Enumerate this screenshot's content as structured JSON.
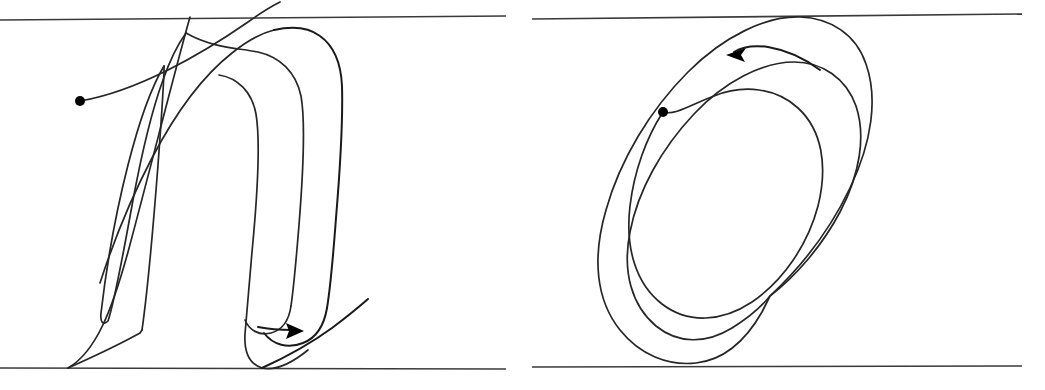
{
  "figure": {
    "title": "Handwritten letter stroke trajectories",
    "background_color": "#ffffff",
    "ink_color": "#1a1a1a",
    "guideline_color": "#3a3a3a",
    "width": 1045,
    "height": 390,
    "panel_count": 2
  },
  "panels": [
    {
      "id": "panel-left",
      "letter": "n",
      "description": "Cursive lowercase n drawn as a single continuous looping stroke",
      "stroke_count": 1,
      "start_marker": {
        "type": "dot",
        "x": 80,
        "y": 101,
        "radius": 5,
        "color": "#000000"
      },
      "end_marker": {
        "type": "arrowhead",
        "x": 300,
        "y": 331,
        "direction": "right",
        "angle_deg": 15,
        "color": "#000000"
      },
      "guidelines": {
        "top": {
          "x1": 0,
          "y1": 20,
          "x2": 506,
          "y2": 16
        },
        "bottom": {
          "x1": 0,
          "y1": 368,
          "x2": 506,
          "y2": 369
        }
      }
    },
    {
      "id": "panel-right",
      "letter": "o",
      "description": "Cursive lowercase o drawn as overlapping tilted ellipse loops",
      "stroke_count": 1,
      "loop_count": 3,
      "start_marker": {
        "type": "dot",
        "x": 663,
        "y": 112,
        "radius": 5,
        "color": "#000000"
      },
      "end_marker": {
        "type": "arrowhead",
        "x": 729,
        "y": 54,
        "direction": "left",
        "angle_deg": 200,
        "color": "#000000"
      },
      "guidelines": {
        "top": {
          "x1": 532,
          "y1": 19,
          "x2": 1022,
          "y2": 14
        },
        "bottom": {
          "x1": 532,
          "y1": 367,
          "x2": 1022,
          "y2": 366
        }
      }
    }
  ],
  "legend": {
    "start_dot_meaning": "pen-down start of stroke",
    "arrow_meaning": "direction and end of stroke"
  }
}
